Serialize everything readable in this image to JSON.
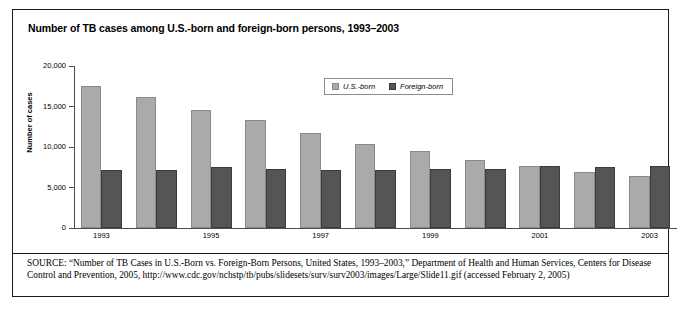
{
  "figure": {
    "title": "Number of TB cases among U.S.-born and foreign-born persons, 1993–2003",
    "source_kicker": "SOURCE:",
    "source_text": " “Number of TB Cases in U.S.-Born vs. Foreign-Born Persons, United States, 1993–2003,” Department of Health and Human Services, Centers for Disease Control and Prevention, 2005, http://www.cdc.gov/nchstp/tb/pubs/slidesets/surv/surv2003/images/Large/Slide11.gif (accessed February 2, 2005)"
  },
  "legend": {
    "position": "top-center",
    "items": [
      {
        "label": "U.S.-born",
        "color": "#aaaaaa"
      },
      {
        "label": "Foreign-born",
        "color": "#555555"
      }
    ]
  },
  "axes": {
    "y_title": "Number of cases",
    "y_ticks": [
      "20,000",
      "15,000",
      "10,000",
      "5,000",
      "0"
    ],
    "x_tick_labels": [
      "1993",
      "1995",
      "1997",
      "1999",
      "2001",
      "2003"
    ]
  },
  "chart_data": {
    "type": "bar",
    "title": "Number of TB cases among U.S.-born and foreign-born persons, 1993–2003",
    "xlabel": "",
    "ylabel": "Number of cases",
    "ylim": [
      0,
      20000
    ],
    "ytick_values": [
      0,
      5000,
      10000,
      15000,
      20000
    ],
    "grid": false,
    "legend_position": "top-center",
    "categories": [
      "1993",
      "1994",
      "1995",
      "1996",
      "1997",
      "1998",
      "1999",
      "2000",
      "2001",
      "2002",
      "2003"
    ],
    "labeled_categories": [
      "1993",
      "1995",
      "1997",
      "1999",
      "2001",
      "2003"
    ],
    "series": [
      {
        "name": "U.S.-born",
        "color": "#aaaaaa",
        "values": [
          17500,
          16200,
          14600,
          13300,
          11700,
          10400,
          9500,
          8400,
          7600,
          6900,
          6400
        ]
      },
      {
        "name": "Foreign-born",
        "color": "#555555",
        "values": [
          7200,
          7200,
          7500,
          7300,
          7200,
          7200,
          7300,
          7300,
          7600,
          7500,
          7700
        ]
      }
    ]
  }
}
